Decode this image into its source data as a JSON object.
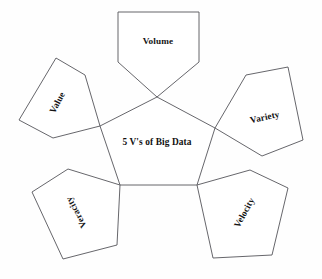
{
  "diagram": {
    "title": "5 V's of Big Data",
    "type": "petal-pentagon-diagram",
    "center": {
      "label": "5 V's of Big Data",
      "text_x": 157,
      "text_y": 143,
      "rotation": 0,
      "polygon": "157,97 215,128 197,185 120,185 100,126"
    },
    "colors": {
      "background": "#fefefe",
      "shape_fill": "#ffffff",
      "stroke": "#55555a",
      "text": "#141414"
    },
    "petals": [
      {
        "id": "volume",
        "label": "Volume",
        "polygon": "118,12 199,12 199,62 157,97 118,62",
        "text_x": 158,
        "text_y": 42,
        "rotation": 0
      },
      {
        "id": "variety",
        "label": "Variety",
        "polygon": "215,128 246,75 288,67 303,140 262,156",
        "text_x": 265,
        "text_y": 118,
        "rotation": -12
      },
      {
        "id": "velocity",
        "label": "Velocity",
        "polygon": "197,185 250,170 288,188 272,255 213,258",
        "text_x": 245,
        "text_y": 213,
        "rotation": -61
      },
      {
        "id": "veracity",
        "label": "Veracity",
        "polygon": "120,185 117,245 63,259 32,192 68,169",
        "text_x": 77,
        "text_y": 212,
        "rotation": -118
      },
      {
        "id": "value",
        "label": "Value",
        "polygon": "100,126 85,75 56,58 19,120 53,138",
        "text_x": 58,
        "text_y": 103,
        "rotation": -62
      }
    ]
  }
}
